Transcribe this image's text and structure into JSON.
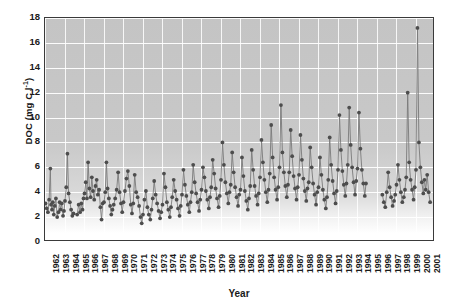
{
  "chart_data": {
    "type": "line",
    "title": "",
    "xlabel": "Year",
    "ylabel": "DOC (mg C l-1)",
    "ylabel_prefix": "DOC (mg C l",
    "ylabel_sup": "-1",
    "ylabel_suffix": ")",
    "xlim": [
      1962,
      2002
    ],
    "ylim": [
      0,
      18
    ],
    "yticks": [
      0,
      2,
      4,
      6,
      8,
      10,
      12,
      14,
      16,
      18
    ],
    "xticks": [
      1962,
      1963,
      1964,
      1965,
      1966,
      1967,
      1968,
      1969,
      1970,
      1971,
      1972,
      1973,
      1974,
      1975,
      1976,
      1977,
      1978,
      1979,
      1980,
      1981,
      1982,
      1983,
      1984,
      1985,
      1986,
      1987,
      1988,
      1989,
      1990,
      1991,
      1992,
      1993,
      1994,
      1995,
      1996,
      1997,
      1998,
      1999,
      2000,
      2001
    ],
    "grid": true,
    "legend": "none",
    "marker": "circle",
    "marker_color": "#4d4d4d",
    "line_color": "#7a7a7a",
    "plot_background": "#c8c8c8",
    "gridline_color": "#ffffff",
    "series": [
      {
        "name": "DOC",
        "x": [
          1962.05,
          1962.18,
          1962.3,
          1962.42,
          1962.55,
          1962.62,
          1962.72,
          1962.8,
          1962.9,
          1963.0,
          1963.12,
          1963.25,
          1963.38,
          1963.5,
          1963.6,
          1963.72,
          1963.85,
          1963.95,
          1964.05,
          1964.18,
          1964.3,
          1964.42,
          1964.55,
          1964.68,
          1964.8,
          1964.92,
          1965.3,
          1965.45,
          1965.6,
          1965.72,
          1965.85,
          1965.95,
          1966.05,
          1966.18,
          1966.3,
          1966.42,
          1966.55,
          1966.68,
          1966.8,
          1966.92,
          1967.05,
          1967.18,
          1967.3,
          1967.42,
          1967.55,
          1967.68,
          1967.8,
          1967.92,
          1968.05,
          1968.18,
          1968.3,
          1968.42,
          1968.55,
          1968.68,
          1968.8,
          1968.92,
          1969.05,
          1969.2,
          1969.35,
          1969.5,
          1969.65,
          1969.8,
          1969.92,
          1970.05,
          1970.2,
          1970.35,
          1970.5,
          1970.65,
          1970.8,
          1970.92,
          1971.05,
          1971.2,
          1971.35,
          1971.5,
          1971.65,
          1971.8,
          1971.92,
          1972.05,
          1972.2,
          1972.35,
          1972.5,
          1972.65,
          1972.8,
          1972.92,
          1973.05,
          1973.2,
          1973.35,
          1973.5,
          1973.65,
          1973.8,
          1973.92,
          1974.05,
          1974.2,
          1974.35,
          1974.5,
          1974.65,
          1974.8,
          1974.92,
          1975.05,
          1975.2,
          1975.35,
          1975.5,
          1975.65,
          1975.8,
          1975.92,
          1976.05,
          1976.2,
          1976.35,
          1976.5,
          1976.65,
          1976.8,
          1976.92,
          1977.05,
          1977.2,
          1977.35,
          1977.5,
          1977.65,
          1977.8,
          1977.92,
          1978.05,
          1978.2,
          1978.35,
          1978.5,
          1978.65,
          1978.8,
          1978.92,
          1979.05,
          1979.2,
          1979.35,
          1979.5,
          1979.65,
          1979.8,
          1979.92,
          1980.05,
          1980.2,
          1980.35,
          1980.5,
          1980.65,
          1980.8,
          1980.92,
          1981.05,
          1981.2,
          1981.35,
          1981.5,
          1981.65,
          1981.8,
          1981.92,
          1982.05,
          1982.2,
          1982.35,
          1982.5,
          1982.65,
          1982.8,
          1982.92,
          1983.05,
          1983.2,
          1983.35,
          1983.5,
          1983.65,
          1983.8,
          1983.92,
          1984.05,
          1984.2,
          1984.35,
          1984.5,
          1984.65,
          1984.8,
          1984.92,
          1985.05,
          1985.2,
          1985.35,
          1985.5,
          1985.65,
          1985.8,
          1985.92,
          1986.05,
          1986.2,
          1986.35,
          1986.5,
          1986.65,
          1986.8,
          1986.92,
          1987.05,
          1987.2,
          1987.35,
          1987.5,
          1987.65,
          1987.8,
          1987.92,
          1988.05,
          1988.2,
          1988.35,
          1988.5,
          1988.65,
          1988.8,
          1988.92,
          1989.05,
          1989.2,
          1989.35,
          1989.5,
          1989.65,
          1989.8,
          1989.92,
          1990.05,
          1990.2,
          1990.35,
          1990.5,
          1990.65,
          1990.8,
          1990.92,
          1991.05,
          1991.2,
          1991.35,
          1991.5,
          1991.65,
          1991.8,
          1991.92,
          1992.05,
          1992.2,
          1992.35,
          1992.5,
          1992.65,
          1992.8,
          1992.92,
          1993.05,
          1993.2,
          1993.35,
          1993.5,
          1993.65,
          1993.8,
          1993.92,
          1994.05,
          1994.2,
          1994.35,
          1994.5,
          1994.65,
          1994.8,
          1994.92,
          1996.6,
          1996.75,
          1996.9,
          1997.05,
          1997.2,
          1997.35,
          1997.5,
          1997.65,
          1997.8,
          1997.92,
          1998.05,
          1998.2,
          1998.35,
          1998.5,
          1998.65,
          1998.8,
          1998.92,
          1999.05,
          1999.2,
          1999.35,
          1999.5,
          1999.65,
          1999.8,
          1999.92,
          2000.05,
          2000.2,
          2000.35,
          2000.5,
          2000.65,
          2000.8,
          2000.92,
          2001.05,
          2001.2,
          2001.35,
          2001.5
        ],
        "y": [
          3.1,
          2.7,
          2.4,
          3.4,
          5.9,
          3.0,
          2.6,
          3.2,
          2.2,
          2.9,
          3.5,
          2.0,
          2.4,
          3.2,
          2.6,
          3.1,
          2.1,
          2.5,
          3.3,
          4.4,
          7.1,
          3.9,
          3.2,
          2.6,
          2.1,
          2.3,
          2.2,
          3.0,
          2.4,
          3.1,
          2.6,
          3.5,
          3.9,
          4.8,
          3.5,
          6.4,
          4.3,
          3.6,
          5.2,
          4.1,
          3.4,
          4.5,
          5.0,
          3.8,
          4.2,
          2.8,
          1.8,
          3.1,
          3.2,
          4.0,
          6.4,
          4.3,
          3.5,
          2.9,
          2.2,
          2.6,
          3.0,
          3.5,
          4.2,
          5.6,
          4.0,
          3.1,
          2.4,
          3.2,
          4.1,
          5.1,
          5.7,
          4.5,
          3.0,
          2.3,
          3.1,
          5.4,
          4.0,
          3.6,
          2.9,
          2.0,
          1.5,
          2.2,
          3.4,
          4.1,
          2.8,
          2.2,
          1.8,
          2.6,
          3.5,
          4.9,
          3.8,
          3.1,
          2.5,
          1.9,
          2.4,
          3.0,
          5.5,
          4.4,
          3.2,
          2.6,
          2.0,
          2.8,
          3.6,
          5.0,
          4.1,
          3.4,
          2.7,
          2.1,
          2.9,
          3.8,
          5.8,
          4.6,
          3.7,
          3.0,
          2.4,
          3.2,
          4.0,
          6.2,
          4.8,
          3.9,
          3.2,
          2.5,
          3.4,
          4.2,
          6.0,
          5.2,
          4.1,
          3.4,
          2.7,
          3.6,
          4.4,
          6.6,
          5.5,
          4.3,
          3.5,
          2.8,
          3.7,
          5.0,
          8.0,
          6.2,
          4.8,
          3.9,
          3.1,
          4.0,
          4.6,
          7.2,
          5.6,
          4.4,
          3.6,
          2.9,
          3.8,
          4.2,
          6.8,
          5.3,
          4.1,
          3.3,
          2.6,
          3.5,
          4.5,
          7.4,
          5.8,
          4.5,
          3.7,
          3.0,
          3.9,
          5.2,
          8.2,
          6.4,
          5.0,
          4.0,
          3.2,
          4.2,
          5.5,
          9.4,
          6.8,
          5.2,
          4.2,
          3.4,
          4.4,
          6.0,
          11.0,
          7.2,
          5.6,
          4.5,
          3.6,
          4.6,
          5.6,
          9.0,
          6.9,
          5.3,
          4.3,
          3.4,
          4.4,
          5.4,
          8.6,
          6.6,
          5.1,
          4.1,
          3.3,
          4.3,
          4.8,
          7.6,
          6.0,
          4.7,
          3.8,
          3.0,
          4.0,
          4.4,
          6.8,
          5.4,
          4.2,
          3.4,
          2.7,
          3.6,
          5.0,
          8.4,
          6.2,
          4.9,
          3.9,
          3.1,
          4.1,
          5.8,
          10.2,
          7.4,
          5.7,
          4.6,
          3.7,
          4.7,
          6.2,
          10.8,
          7.8,
          6.0,
          4.8,
          3.8,
          4.9,
          5.9,
          10.4,
          7.5,
          5.8,
          4.7,
          3.7,
          4.7,
          3.8,
          3.2,
          2.8,
          4.0,
          5.6,
          4.4,
          3.6,
          2.9,
          3.3,
          3.8,
          4.6,
          6.2,
          5.0,
          4.0,
          3.2,
          3.6,
          4.2,
          5.2,
          12.0,
          6.4,
          5.0,
          4.2,
          3.4,
          4.4,
          5.8,
          17.2,
          8.0,
          6.0,
          4.8,
          3.9,
          5.0,
          4.2,
          5.4,
          4.0,
          3.2
        ]
      }
    ]
  }
}
